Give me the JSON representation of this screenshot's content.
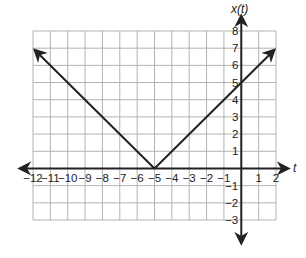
{
  "chart_data": {
    "type": "line",
    "title": "",
    "xlabel": "t",
    "ylabel": "x(t)",
    "xlim": [
      -12,
      2
    ],
    "ylim": [
      -3,
      8
    ],
    "grid": true,
    "legend": null,
    "x_ticks": [
      -12,
      -11,
      -10,
      -9,
      -8,
      -7,
      -6,
      -5,
      -4,
      -3,
      -2,
      -1,
      1,
      2
    ],
    "y_ticks": [
      8,
      7,
      6,
      5,
      4,
      3,
      2,
      1,
      -1,
      -2,
      -3
    ],
    "x_tick_labels": [
      "−12",
      "−11",
      "−10",
      "−9",
      "−8",
      "−7",
      "−6",
      "−5",
      "−4",
      "−3",
      "−2",
      "−1",
      "1",
      "2"
    ],
    "y_tick_labels": [
      "8",
      "7",
      "6",
      "5",
      "4",
      "3",
      "2",
      "1",
      "−1",
      "−2",
      "−3"
    ],
    "series": [
      {
        "name": "x(t) = |t + 5|",
        "x": [
          -12,
          -5,
          2
        ],
        "y": [
          7,
          0,
          7
        ],
        "arrows_at_ends": true,
        "color": "#222222"
      }
    ],
    "annotations": []
  },
  "colors": {
    "grid": "#b3b3b3",
    "axis": "#222222",
    "line": "#222222",
    "background": "#ffffff"
  }
}
